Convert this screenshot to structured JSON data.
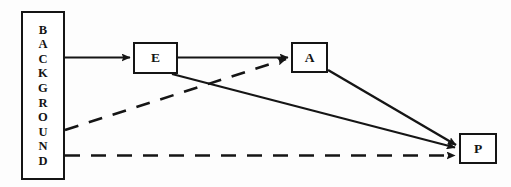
{
  "figure": {
    "type": "path-diagram",
    "background_color": "#fdfdfd",
    "line_color": "#151515",
    "box_fill": "#ffffff"
  },
  "nodes": [
    {
      "id": "background",
      "label": "BACKGROUND",
      "letters": [
        "B",
        "A",
        "C",
        "K",
        "G",
        "R",
        "O",
        "U",
        "N",
        "D"
      ],
      "orientation": "vertical",
      "shape": "rectangle"
    },
    {
      "id": "e",
      "label": "E",
      "orientation": "horizontal",
      "shape": "rectangle"
    },
    {
      "id": "a",
      "label": "A",
      "orientation": "horizontal",
      "shape": "rectangle"
    },
    {
      "id": "p",
      "label": "P",
      "orientation": "horizontal",
      "shape": "rectangle"
    }
  ],
  "edges": [
    {
      "id": "background-to-e",
      "from": "background",
      "to": "e",
      "style": "solid",
      "arrowhead": true
    },
    {
      "id": "e-to-a",
      "from": "e",
      "to": "a",
      "style": "solid",
      "arrowhead": true
    },
    {
      "id": "e-to-p",
      "from": "e",
      "to": "p",
      "style": "solid",
      "arrowhead": true
    },
    {
      "id": "a-to-p",
      "from": "a",
      "to": "p",
      "style": "solid",
      "arrowhead": true
    },
    {
      "id": "background-to-a",
      "from": "background",
      "to": "a",
      "style": "dashed",
      "arrowhead": true
    },
    {
      "id": "background-to-p",
      "from": "background",
      "to": "p",
      "style": "dashed",
      "arrowhead": true
    }
  ]
}
